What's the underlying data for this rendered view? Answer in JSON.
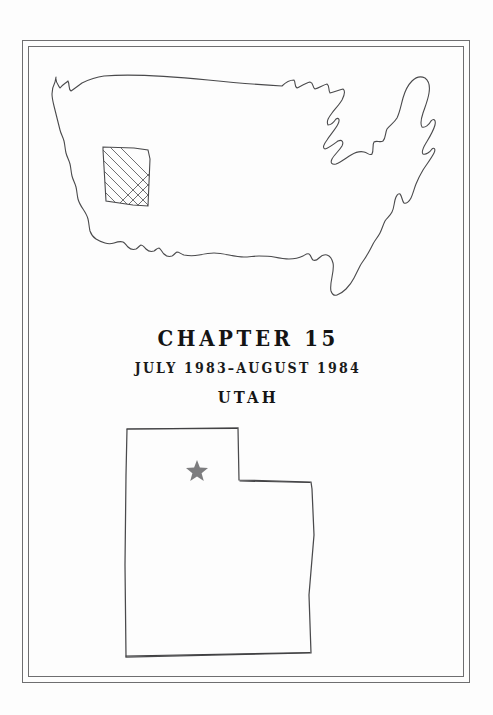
{
  "page": {
    "kind": "book-chapter-title-page",
    "paper_color": "#fdfdfd",
    "ink_color": "#3a3a3c",
    "border_color": "#6e6e70"
  },
  "border": {
    "style": "double-rule-rectangle",
    "outer": {
      "x": 22,
      "y": 40,
      "width": 448,
      "height": 643
    },
    "inner": {
      "x": 28,
      "y": 46,
      "width": 436,
      "height": 631
    }
  },
  "us_map": {
    "name": "united-states-outline-map",
    "description": "hand-drawn contiguous United States outline",
    "highlighted_state": "Utah",
    "highlight_style": "cross-hatch",
    "highlight_color": "#3a3a3c"
  },
  "heading": {
    "chapter_label": "CHAPTER 15",
    "date_range": "JULY 1983–AUGUST 1984",
    "state": "UTAH"
  },
  "utah_inset": {
    "name": "utah-state-outline-map",
    "description": "hand-drawn outline of the state of Utah",
    "marker": {
      "glyph": "star",
      "color": "#7d7d7f",
      "x": 197,
      "y": 466
    }
  }
}
